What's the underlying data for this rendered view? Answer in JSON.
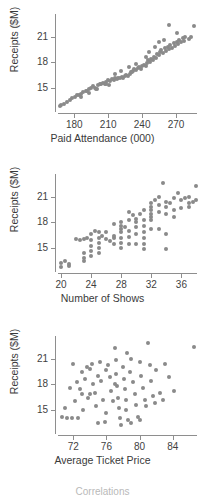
{
  "figure": {
    "footer_note": "Correlations",
    "point_color": "#8a8a8a",
    "axis_color": "#8e8e8e",
    "text_color": "#3a3a3a",
    "background": "#ffffff"
  },
  "chart_data": [
    {
      "type": "scatter",
      "title": "",
      "xlabel": "Paid Attendance (000)",
      "ylabel": "Receipts ($M)",
      "xticks": [
        180,
        210,
        240,
        270
      ],
      "yticks": [
        15,
        18,
        21
      ],
      "xlim": [
        163,
        292
      ],
      "ylim": [
        12.4,
        23.4
      ],
      "grid": false,
      "legend": "none",
      "relationship": "strong positive linear",
      "points": [
        [
          167.0,
          12.9
        ],
        [
          168.5,
          13.0
        ],
        [
          171.0,
          13.1
        ],
        [
          173.5,
          13.3
        ],
        [
          176.0,
          13.6
        ],
        [
          178.0,
          13.8
        ],
        [
          180.5,
          13.9
        ],
        [
          182.0,
          14.1
        ],
        [
          184.0,
          14.2
        ],
        [
          186.0,
          14.3
        ],
        [
          188.0,
          14.5
        ],
        [
          190.0,
          14.6
        ],
        [
          191.5,
          14.6
        ],
        [
          193.0,
          14.8
        ],
        [
          195.0,
          15.0
        ],
        [
          196.5,
          15.2
        ],
        [
          198.0,
          15.0
        ],
        [
          199.5,
          14.9
        ],
        [
          201.0,
          15.3
        ],
        [
          202.5,
          15.5
        ],
        [
          204.0,
          15.4
        ],
        [
          205.5,
          15.6
        ],
        [
          207.0,
          15.5
        ],
        [
          208.0,
          15.7
        ],
        [
          209.5,
          15.9
        ],
        [
          211.0,
          15.3
        ],
        [
          212.0,
          15.8
        ],
        [
          213.5,
          16.0
        ],
        [
          215.0,
          15.9
        ],
        [
          216.0,
          16.1
        ],
        [
          217.5,
          16.0
        ],
        [
          219.0,
          16.2
        ],
        [
          220.5,
          16.1
        ],
        [
          222.0,
          16.3
        ],
        [
          223.0,
          16.2
        ],
        [
          224.5,
          16.4
        ],
        [
          226.0,
          16.5
        ],
        [
          227.5,
          16.4
        ],
        [
          229.0,
          16.6
        ],
        [
          230.5,
          16.8
        ],
        [
          232.0,
          17.0
        ],
        [
          233.0,
          17.2
        ],
        [
          234.5,
          17.1
        ],
        [
          236.0,
          17.3
        ],
        [
          237.5,
          17.4
        ],
        [
          239.0,
          17.2
        ],
        [
          240.0,
          17.5
        ],
        [
          241.5,
          17.7
        ],
        [
          243.0,
          17.6
        ],
        [
          244.0,
          17.9
        ],
        [
          245.5,
          18.2
        ],
        [
          247.0,
          18.0
        ],
        [
          248.0,
          18.4
        ],
        [
          249.5,
          18.3
        ],
        [
          250.5,
          18.6
        ],
        [
          252.0,
          18.5
        ],
        [
          253.0,
          19.0
        ],
        [
          254.5,
          18.8
        ],
        [
          256.0,
          19.2
        ],
        [
          257.0,
          19.4
        ],
        [
          258.5,
          19.1
        ],
        [
          260.0,
          19.6
        ],
        [
          261.0,
          19.3
        ],
        [
          262.5,
          19.8
        ],
        [
          264.0,
          19.5
        ],
        [
          265.0,
          20.0
        ],
        [
          266.5,
          19.7
        ],
        [
          268.0,
          20.2
        ],
        [
          269.0,
          19.9
        ],
        [
          270.5,
          20.4
        ],
        [
          272.0,
          20.1
        ],
        [
          273.0,
          20.6
        ],
        [
          274.5,
          20.3
        ],
        [
          276.0,
          20.8
        ],
        [
          277.0,
          20.5
        ],
        [
          264.0,
          22.3
        ],
        [
          271.0,
          21.4
        ],
        [
          278.0,
          21.0
        ],
        [
          286.0,
          22.2
        ],
        [
          281.0,
          20.7
        ],
        [
          283.0,
          20.9
        ],
        [
          246.0,
          19.2
        ],
        [
          251.0,
          19.8
        ],
        [
          255.0,
          20.3
        ],
        [
          259.0,
          20.6
        ],
        [
          221.0,
          17.0
        ],
        [
          228.0,
          17.4
        ],
        [
          235.0,
          17.8
        ],
        [
          243.0,
          18.6
        ],
        [
          186.0,
          13.9
        ],
        [
          193.0,
          14.4
        ],
        [
          200.0,
          14.9
        ],
        [
          208.0,
          15.4
        ],
        [
          216.0,
          16.6
        ],
        [
          231.0,
          16.9
        ]
      ]
    },
    {
      "type": "scatter",
      "title": "",
      "xlabel": "Number of Shows",
      "ylabel": "Receipts ($M)",
      "xticks": [
        20,
        24,
        28,
        32,
        36
      ],
      "yticks": [
        15,
        18,
        21
      ],
      "xlim": [
        19.2,
        38.6
      ],
      "ylim": [
        12.4,
        23.4
      ],
      "grid": false,
      "legend": "none",
      "relationship": "moderate positive, x discrete",
      "points": [
        [
          20.0,
          13.2
        ],
        [
          20.0,
          12.8
        ],
        [
          20.5,
          13.5
        ],
        [
          21.0,
          12.9
        ],
        [
          21.0,
          13.1
        ],
        [
          22.0,
          16.0
        ],
        [
          22.5,
          15.9
        ],
        [
          23.0,
          16.0
        ],
        [
          23.0,
          14.4
        ],
        [
          23.0,
          13.8
        ],
        [
          23.0,
          13.4
        ],
        [
          23.5,
          16.1
        ],
        [
          24.0,
          15.9
        ],
        [
          24.0,
          15.2
        ],
        [
          24.0,
          14.6
        ],
        [
          24.0,
          14.0
        ],
        [
          24.5,
          17.0
        ],
        [
          25.0,
          16.9
        ],
        [
          25.0,
          16.2
        ],
        [
          25.0,
          15.6
        ],
        [
          25.0,
          15.0
        ],
        [
          25.0,
          14.4
        ],
        [
          25.5,
          16.4
        ],
        [
          26.0,
          16.0
        ],
        [
          26.0,
          16.8
        ],
        [
          27.0,
          16.1
        ],
        [
          27.0,
          16.4
        ],
        [
          27.0,
          15.4
        ],
        [
          28.0,
          18.0
        ],
        [
          28.0,
          17.6
        ],
        [
          28.0,
          17.2
        ],
        [
          28.0,
          16.8
        ],
        [
          28.0,
          16.2
        ],
        [
          28.0,
          15.6
        ],
        [
          28.0,
          15.0
        ],
        [
          28.5,
          17.4
        ],
        [
          29.0,
          19.2
        ],
        [
          29.0,
          17.0
        ],
        [
          29.0,
          16.3
        ],
        [
          29.0,
          15.5
        ],
        [
          29.5,
          18.8
        ],
        [
          30.0,
          18.4
        ],
        [
          30.0,
          18.0
        ],
        [
          30.0,
          17.4
        ],
        [
          30.0,
          16.6
        ],
        [
          30.5,
          19.0
        ],
        [
          31.0,
          19.4
        ],
        [
          31.0,
          18.2
        ],
        [
          31.0,
          17.6
        ],
        [
          31.0,
          16.9
        ],
        [
          31.0,
          16.2
        ],
        [
          31.0,
          15.4
        ],
        [
          31.0,
          14.8
        ],
        [
          32.0,
          20.2
        ],
        [
          32.0,
          19.8
        ],
        [
          32.0,
          19.4
        ],
        [
          32.0,
          19.0
        ],
        [
          32.0,
          18.6
        ],
        [
          32.0,
          18.2
        ],
        [
          32.0,
          17.2
        ],
        [
          32.5,
          20.6
        ],
        [
          33.0,
          20.0
        ],
        [
          33.0,
          19.2
        ],
        [
          33.0,
          17.2
        ],
        [
          33.5,
          22.6
        ],
        [
          34.0,
          20.4
        ],
        [
          34.0,
          19.8
        ],
        [
          34.0,
          19.0
        ],
        [
          34.0,
          16.6
        ],
        [
          34.0,
          14.8
        ],
        [
          34.5,
          20.2
        ],
        [
          35.0,
          20.8
        ],
        [
          35.0,
          19.4
        ],
        [
          35.5,
          21.4
        ],
        [
          36.0,
          20.6
        ],
        [
          36.0,
          19.6
        ],
        [
          36.5,
          20.8
        ],
        [
          37.0,
          21.0
        ],
        [
          37.0,
          20.2
        ],
        [
          37.0,
          19.8
        ],
        [
          37.5,
          20.4
        ],
        [
          38.0,
          22.2
        ],
        [
          38.0,
          20.6
        ],
        [
          30.0,
          15.4
        ],
        [
          26.5,
          15.8
        ],
        [
          33.0,
          21.0
        ],
        [
          35.0,
          18.6
        ],
        [
          29.0,
          18.2
        ],
        [
          27.0,
          17.8
        ],
        [
          24.0,
          16.6
        ]
      ]
    },
    {
      "type": "scatter",
      "title": "",
      "xlabel": "Average Ticket Price",
      "ylabel": "Receipts ($M)",
      "xticks": [
        72,
        76,
        80,
        84
      ],
      "yticks": [
        15,
        18,
        21
      ],
      "xlim": [
        69.8,
        87.4
      ],
      "ylim": [
        12.4,
        23.4
      ],
      "grid": false,
      "legend": "none",
      "relationship": "weak positive / diffuse cloud",
      "points": [
        [
          70.6,
          14.2
        ],
        [
          71.0,
          15.2
        ],
        [
          71.2,
          14.0
        ],
        [
          71.6,
          17.6
        ],
        [
          71.8,
          14.0
        ],
        [
          72.0,
          20.3
        ],
        [
          72.2,
          16.0
        ],
        [
          72.4,
          18.2
        ],
        [
          72.6,
          14.0
        ],
        [
          72.8,
          17.4
        ],
        [
          73.0,
          19.4
        ],
        [
          73.2,
          15.0
        ],
        [
          73.4,
          18.6
        ],
        [
          73.6,
          20.0
        ],
        [
          73.8,
          16.4
        ],
        [
          74.0,
          19.8
        ],
        [
          74.2,
          20.4
        ],
        [
          74.4,
          18.0
        ],
        [
          74.6,
          17.0
        ],
        [
          74.8,
          15.4
        ],
        [
          75.0,
          19.0
        ],
        [
          75.2,
          20.6
        ],
        [
          75.4,
          18.4
        ],
        [
          75.6,
          16.2
        ],
        [
          75.8,
          13.6
        ],
        [
          76.0,
          19.6
        ],
        [
          76.2,
          20.2
        ],
        [
          76.4,
          18.8
        ],
        [
          76.6,
          17.2
        ],
        [
          76.8,
          16.0
        ],
        [
          77.0,
          22.2
        ],
        [
          77.1,
          20.8
        ],
        [
          77.2,
          19.2
        ],
        [
          77.3,
          17.8
        ],
        [
          77.4,
          16.4
        ],
        [
          77.5,
          15.2
        ],
        [
          77.6,
          14.0
        ],
        [
          77.8,
          13.2
        ],
        [
          78.0,
          20.0
        ],
        [
          78.1,
          18.6
        ],
        [
          78.2,
          17.4
        ],
        [
          78.3,
          16.2
        ],
        [
          78.4,
          15.0
        ],
        [
          78.6,
          13.8
        ],
        [
          78.8,
          19.4
        ],
        [
          79.0,
          21.0
        ],
        [
          79.2,
          18.2
        ],
        [
          79.4,
          16.8
        ],
        [
          79.6,
          15.6
        ],
        [
          79.8,
          14.2
        ],
        [
          80.0,
          20.6
        ],
        [
          80.2,
          19.0
        ],
        [
          80.4,
          17.6
        ],
        [
          80.6,
          16.2
        ],
        [
          80.8,
          15.4
        ],
        [
          81.0,
          22.8
        ],
        [
          81.2,
          20.2
        ],
        [
          81.4,
          18.4
        ],
        [
          81.6,
          16.6
        ],
        [
          81.8,
          15.8
        ],
        [
          82.0,
          19.6
        ],
        [
          82.4,
          17.0
        ],
        [
          82.8,
          16.2
        ],
        [
          83.0,
          20.4
        ],
        [
          83.6,
          18.8
        ],
        [
          84.2,
          17.2
        ],
        [
          79.0,
          13.4
        ],
        [
          80.0,
          13.8
        ],
        [
          76.0,
          14.6
        ],
        [
          75.0,
          13.4
        ],
        [
          73.0,
          16.8
        ],
        [
          74.0,
          16.8
        ],
        [
          77.0,
          18.0
        ],
        [
          78.5,
          21.6
        ],
        [
          86.6,
          22.4
        ]
      ]
    }
  ]
}
